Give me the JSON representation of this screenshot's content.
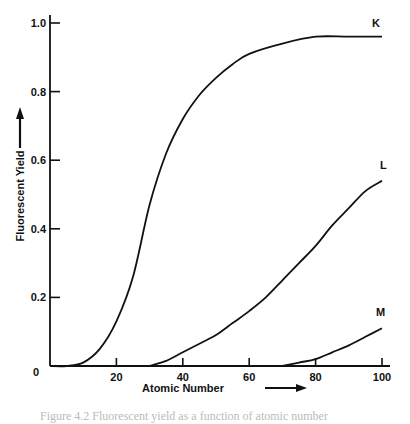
{
  "chart_data": {
    "type": "line",
    "title": "",
    "xlabel": "Atomic Number",
    "ylabel": "Fluorescent Yield",
    "xlim": [
      0,
      100
    ],
    "ylim": [
      0,
      1.0
    ],
    "x_ticks": [
      20,
      40,
      60,
      80,
      100
    ],
    "y_ticks": [
      0,
      0.2,
      0.4,
      0.6,
      0.8,
      1.0
    ],
    "x_tick_labels": [
      "20",
      "40",
      "60",
      "80",
      "100"
    ],
    "y_tick_labels": [
      "0",
      "0.2",
      "0.4",
      "0.6",
      "0.8",
      "1.0"
    ],
    "grid": false,
    "legend": "none (curves labeled inline at right end)",
    "series": [
      {
        "name": "K",
        "x": [
          0,
          5,
          10,
          15,
          20,
          25,
          30,
          35,
          40,
          45,
          50,
          55,
          60,
          70,
          80,
          90,
          100
        ],
        "values": [
          0,
          0,
          0.01,
          0.05,
          0.13,
          0.26,
          0.47,
          0.62,
          0.72,
          0.79,
          0.84,
          0.88,
          0.91,
          0.94,
          0.96,
          0.96,
          0.96
        ]
      },
      {
        "name": "L",
        "x": [
          30,
          35,
          40,
          45,
          50,
          55,
          60,
          65,
          70,
          75,
          80,
          85,
          90,
          95,
          100
        ],
        "values": [
          0,
          0.015,
          0.04,
          0.065,
          0.09,
          0.125,
          0.16,
          0.2,
          0.25,
          0.3,
          0.35,
          0.41,
          0.46,
          0.51,
          0.54
        ]
      },
      {
        "name": "M",
        "x": [
          70,
          75,
          80,
          85,
          90,
          95,
          100
        ],
        "values": [
          0,
          0.01,
          0.02,
          0.04,
          0.06,
          0.085,
          0.11
        ]
      }
    ],
    "annotations": [
      "K",
      "L",
      "M"
    ]
  },
  "caption_fragment": "Figure 4.2  Fluorescent yield as a function of atomic number"
}
